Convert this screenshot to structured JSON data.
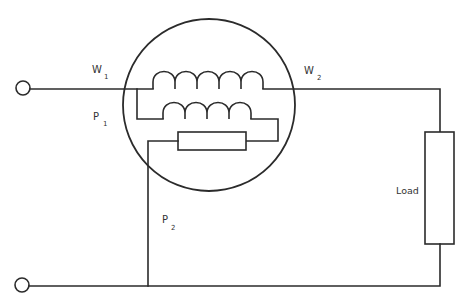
{
  "diagram": {
    "type": "wattmeter connection circuit",
    "colors": {
      "line": "#2b2b2b",
      "text": "#333333",
      "background": "#ffffff"
    },
    "labels": {
      "w1": {
        "main": "W",
        "sub": "1"
      },
      "w2": {
        "main": "W",
        "sub": "2"
      },
      "p1": {
        "main": "P",
        "sub": "1"
      },
      "p2": {
        "main": "P",
        "sub": "2"
      },
      "load": "Load"
    },
    "components": {
      "meter_enclosure": "circle",
      "current_coil": {
        "turns": 5
      },
      "pressure_coil": {
        "turns": 4
      },
      "series_resistor": "rectangle",
      "load": "rectangle",
      "terminals": [
        "supply-terminal-top",
        "supply-terminal-bottom"
      ]
    }
  }
}
